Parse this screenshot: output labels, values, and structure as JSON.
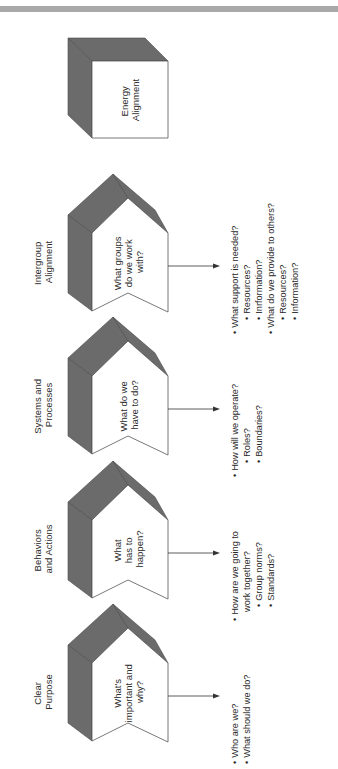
{
  "diagram": {
    "energy": {
      "label_lines": [
        "Energy",
        "Alignment"
      ]
    },
    "stages": [
      {
        "label_lines": [
          "Intergroup",
          "Alignment"
        ],
        "question_lines": [
          "What groups",
          "do we work",
          "with?"
        ],
        "bullets": [
          {
            "level": 1,
            "text": "What support is needed?"
          },
          {
            "level": 2,
            "text": "Resources?"
          },
          {
            "level": 2,
            "text": "Inrformation?"
          },
          {
            "level": 1,
            "text": "What do we provide to others?"
          },
          {
            "level": 2,
            "text": "Resources?"
          },
          {
            "level": 2,
            "text": "Information?"
          }
        ]
      },
      {
        "label_lines": [
          "Systems and",
          "Processes"
        ],
        "question_lines": [
          "What do we",
          "have to do?"
        ],
        "bullets": [
          {
            "level": 1,
            "text": "How will we operate?"
          },
          {
            "level": 2,
            "text": "Roles?"
          },
          {
            "level": 2,
            "text": "Boundaries?"
          }
        ]
      },
      {
        "label_lines": [
          "Behaviors",
          "and Actions"
        ],
        "question_lines": [
          "What",
          "has to",
          "happen?"
        ],
        "bullets": [
          {
            "level": 1,
            "text": "How are we going to"
          },
          {
            "level": 0,
            "text": "work together?"
          },
          {
            "level": 2,
            "text": "Group norms?"
          },
          {
            "level": 2,
            "text": "Standards?"
          }
        ]
      },
      {
        "label_lines": [
          "Clear",
          "Purpose"
        ],
        "question_lines": [
          "What's",
          "important and",
          "why?"
        ],
        "bullets": [
          {
            "level": 1,
            "text": "Who are we?"
          },
          {
            "level": 1,
            "text": "What should we do?"
          }
        ]
      }
    ],
    "bullet_glyph": "•",
    "colors": {
      "shade": "#6b6b6b",
      "face": "#ffffff",
      "bar": "#a9a9a9"
    }
  }
}
